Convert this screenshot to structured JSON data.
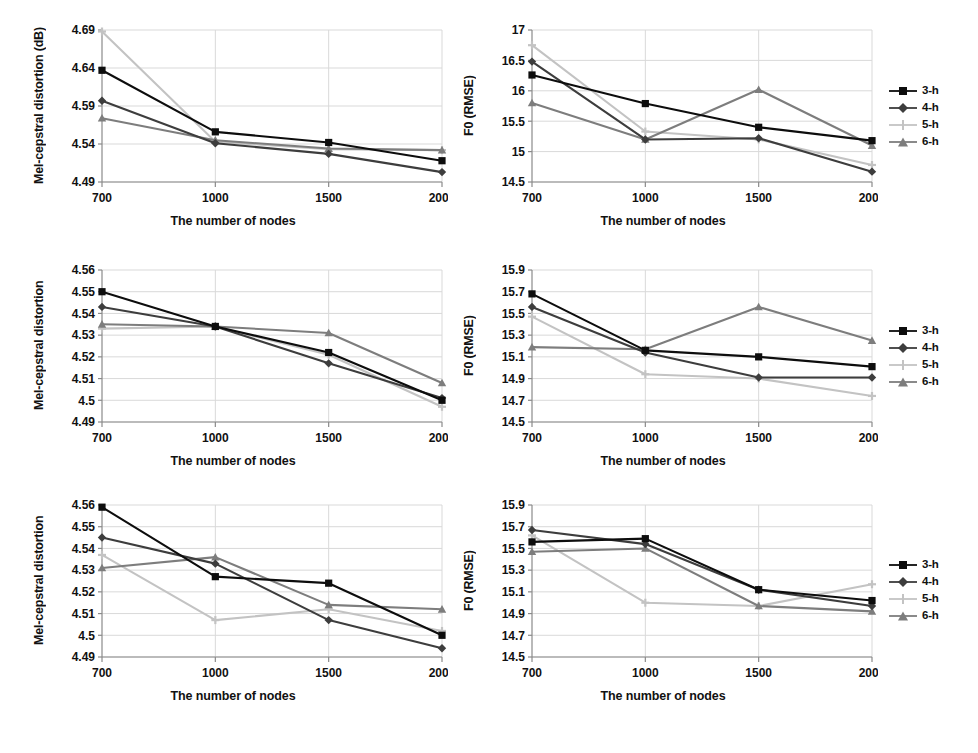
{
  "figure": {
    "background": "#ffffff",
    "x_axis_label": "The number of nodes",
    "categories": [
      "700",
      "1000",
      "1500",
      "2000"
    ],
    "series_colors": {
      "3-h": "#0d0d0d",
      "4-h": "#3d3d3d",
      "5-h": "#c3c3c3",
      "6-h": "#7d7d7d"
    },
    "legend_labels": [
      "3-h",
      "4-h",
      "5-h",
      "6-h"
    ]
  },
  "legends": {
    "top": {
      "items": [
        "3-h",
        "4-h",
        "5-h",
        "6-h"
      ]
    },
    "middle": {
      "items": [
        "3-h",
        "4-h",
        "5-h",
        "6-h"
      ]
    },
    "bottom": {
      "items": [
        "3-h",
        "4-h",
        "5-h",
        "6-h"
      ]
    }
  },
  "chart_data": [
    {
      "id": "chart-top-left",
      "type": "line",
      "title": "",
      "xlabel": "The number of nodes",
      "ylabel": "Mel-cepstral distortion (dB)",
      "categories": [
        "700",
        "1000",
        "1500",
        "2000"
      ],
      "yticks": [
        "4.49",
        "4.54",
        "4.59",
        "4.64",
        "4.69"
      ],
      "ylim": [
        4.49,
        4.69
      ],
      "grid": true,
      "legend_position": "right",
      "series": [
        {
          "name": "3-h",
          "values": [
            4.637,
            4.556,
            4.542,
            4.518
          ],
          "marker": "square",
          "color": "#0d0d0d"
        },
        {
          "name": "4-h",
          "values": [
            4.597,
            4.541,
            4.527,
            4.503
          ],
          "marker": "diamond",
          "color": "#3d3d3d"
        },
        {
          "name": "5-h",
          "values": [
            4.688,
            4.543,
            4.533,
            4.532
          ],
          "marker": "cross",
          "color": "#c3c3c3"
        },
        {
          "name": "6-h",
          "values": [
            4.574,
            4.545,
            4.534,
            4.532
          ],
          "marker": "triangle",
          "color": "#7d7d7d"
        }
      ]
    },
    {
      "id": "chart-top-right",
      "type": "line",
      "title": "",
      "xlabel": "The number of nodes",
      "ylabel": "F0 (RMSE)",
      "categories": [
        "700",
        "1000",
        "1500",
        "2000"
      ],
      "yticks": [
        "14.5",
        "15",
        "15.5",
        "16",
        "16.5",
        "17"
      ],
      "ylim": [
        14.5,
        17
      ],
      "grid": true,
      "legend_position": "right",
      "series": [
        {
          "name": "3-h",
          "values": [
            16.26,
            15.79,
            15.4,
            15.18
          ],
          "marker": "square",
          "color": "#0d0d0d"
        },
        {
          "name": "4-h",
          "values": [
            16.48,
            15.2,
            15.22,
            14.67
          ],
          "marker": "diamond",
          "color": "#3d3d3d"
        },
        {
          "name": "5-h",
          "values": [
            16.75,
            15.33,
            15.2,
            14.78
          ],
          "marker": "cross",
          "color": "#c3c3c3"
        },
        {
          "name": "6-h",
          "values": [
            15.8,
            15.2,
            16.02,
            15.1
          ],
          "marker": "triangle",
          "color": "#7d7d7d"
        }
      ]
    },
    {
      "id": "chart-middle-left",
      "type": "line",
      "title": "",
      "xlabel": "The number of nodes",
      "ylabel": "Mel-cepstral distortion",
      "categories": [
        "700",
        "1000",
        "1500",
        "2000"
      ],
      "yticks": [
        "4.49",
        "4.5",
        "4.51",
        "4.52",
        "4.53",
        "4.54",
        "4.55",
        "4.56"
      ],
      "ylim": [
        4.49,
        4.56
      ],
      "grid": true,
      "legend_position": "right",
      "series": [
        {
          "name": "3-h",
          "values": [
            4.55,
            4.534,
            4.522,
            4.5
          ],
          "marker": "square",
          "color": "#0d0d0d"
        },
        {
          "name": "4-h",
          "values": [
            4.543,
            4.534,
            4.517,
            4.501
          ],
          "marker": "diamond",
          "color": "#3d3d3d"
        },
        {
          "name": "5-h",
          "values": [
            4.533,
            4.534,
            4.521,
            4.497
          ],
          "marker": "cross",
          "color": "#c3c3c3"
        },
        {
          "name": "6-h",
          "values": [
            4.535,
            4.534,
            4.531,
            4.508
          ],
          "marker": "triangle",
          "color": "#7d7d7d"
        }
      ]
    },
    {
      "id": "chart-middle-right",
      "type": "line",
      "title": "",
      "xlabel": "The number of nodes",
      "ylabel": "F0 (RMSE)",
      "categories": [
        "700",
        "1000",
        "1500",
        "2000"
      ],
      "yticks": [
        "14.5",
        "14.7",
        "14.9",
        "15.1",
        "15.3",
        "15.5",
        "15.7",
        "15.9"
      ],
      "ylim": [
        14.5,
        15.9
      ],
      "grid": true,
      "legend_position": "right",
      "series": [
        {
          "name": "3-h",
          "values": [
            15.68,
            15.16,
            15.1,
            15.01
          ],
          "marker": "square",
          "color": "#0d0d0d"
        },
        {
          "name": "4-h",
          "values": [
            15.56,
            15.14,
            14.91,
            14.91
          ],
          "marker": "diamond",
          "color": "#3d3d3d"
        },
        {
          "name": "5-h",
          "values": [
            15.47,
            14.94,
            14.9,
            14.74
          ],
          "marker": "cross",
          "color": "#c3c3c3"
        },
        {
          "name": "6-h",
          "values": [
            15.19,
            15.17,
            15.56,
            15.25
          ],
          "marker": "triangle",
          "color": "#7d7d7d"
        }
      ]
    },
    {
      "id": "chart-bottom-left",
      "type": "line",
      "title": "",
      "xlabel": "The number of nodes",
      "ylabel": "Mel-cepstral distortion",
      "categories": [
        "700",
        "1000",
        "1500",
        "2000"
      ],
      "yticks": [
        "4.49",
        "4.5",
        "4.51",
        "4.52",
        "4.53",
        "4.54",
        "4.55",
        "4.56"
      ],
      "ylim": [
        4.49,
        4.56
      ],
      "grid": true,
      "legend_position": "right",
      "series": [
        {
          "name": "3-h",
          "values": [
            4.559,
            4.527,
            4.524,
            4.5
          ],
          "marker": "square",
          "color": "#0d0d0d"
        },
        {
          "name": "4-h",
          "values": [
            4.545,
            4.533,
            4.507,
            4.494
          ],
          "marker": "diamond",
          "color": "#3d3d3d"
        },
        {
          "name": "5-h",
          "values": [
            4.537,
            4.507,
            4.512,
            4.502
          ],
          "marker": "cross",
          "color": "#c3c3c3"
        },
        {
          "name": "6-h",
          "values": [
            4.531,
            4.536,
            4.514,
            4.512
          ],
          "marker": "triangle",
          "color": "#7d7d7d"
        }
      ]
    },
    {
      "id": "chart-bottom-right",
      "type": "line",
      "title": "",
      "xlabel": "The number of nodes",
      "ylabel": "F0 (RMSE)",
      "categories": [
        "700",
        "1000",
        "1500",
        "2000"
      ],
      "yticks": [
        "14.5",
        "14.7",
        "14.9",
        "15.1",
        "15.3",
        "15.5",
        "15.7",
        "15.9"
      ],
      "ylim": [
        14.5,
        15.9
      ],
      "grid": true,
      "legend_position": "right",
      "series": [
        {
          "name": "3-h",
          "values": [
            15.56,
            15.59,
            15.12,
            15.02
          ],
          "marker": "square",
          "color": "#0d0d0d"
        },
        {
          "name": "4-h",
          "values": [
            15.67,
            15.54,
            15.12,
            14.97
          ],
          "marker": "diamond",
          "color": "#3d3d3d"
        },
        {
          "name": "5-h",
          "values": [
            15.62,
            15.0,
            14.97,
            15.17
          ],
          "marker": "cross",
          "color": "#c3c3c3"
        },
        {
          "name": "6-h",
          "values": [
            15.47,
            15.5,
            14.97,
            14.92
          ],
          "marker": "triangle",
          "color": "#7d7d7d"
        }
      ]
    }
  ]
}
